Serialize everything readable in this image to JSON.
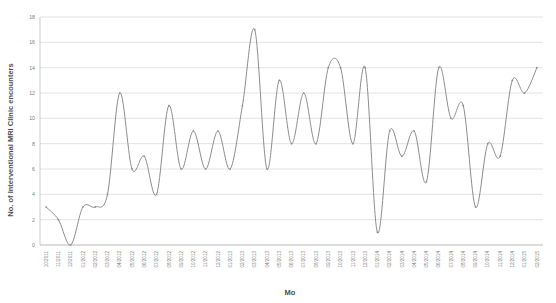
{
  "chart_data": {
    "type": "line",
    "title": "",
    "xlabel": "Mo",
    "ylabel": "No. of Interventional MRI Clinic encounters",
    "ylim": [
      0,
      18
    ],
    "ytick_step": 2,
    "yticks": [
      0,
      2,
      4,
      6,
      8,
      10,
      12,
      14,
      16,
      18
    ],
    "grid": true,
    "legend": false,
    "line_color": "#8c8c8c",
    "grid_color": "#d0d0d0",
    "text_color": "#808080",
    "categories": [
      "10/2011",
      "11/2011",
      "12/2011",
      "01/2012",
      "02/2012",
      "03/2012",
      "04/2012",
      "05/2012",
      "06/2012",
      "07/2012",
      "08/2012",
      "09/2012",
      "10/2012",
      "11/2012",
      "12/2012",
      "01/2013",
      "02/2013",
      "03/2013",
      "04/2013",
      "05/2013",
      "06/2013",
      "07/2013",
      "08/2013",
      "09/2013",
      "10/2013",
      "11/2013",
      "12/2013",
      "01/2014",
      "02/2014",
      "03/2014",
      "04/2014",
      "05/2014",
      "06/2014",
      "07/2014",
      "08/2014",
      "09/2014",
      "10/2014",
      "11/2014",
      "12/2014",
      "01/2015",
      "02/2015"
    ],
    "values": [
      3,
      2,
      0,
      3,
      3,
      4,
      12,
      6,
      7,
      4,
      11,
      6,
      9,
      6,
      9,
      6,
      11,
      17,
      6,
      13,
      8,
      12,
      8,
      14,
      14,
      8,
      14,
      1,
      9,
      7,
      9,
      5,
      14,
      10,
      11,
      3,
      8,
      7,
      13,
      12,
      14
    ]
  }
}
